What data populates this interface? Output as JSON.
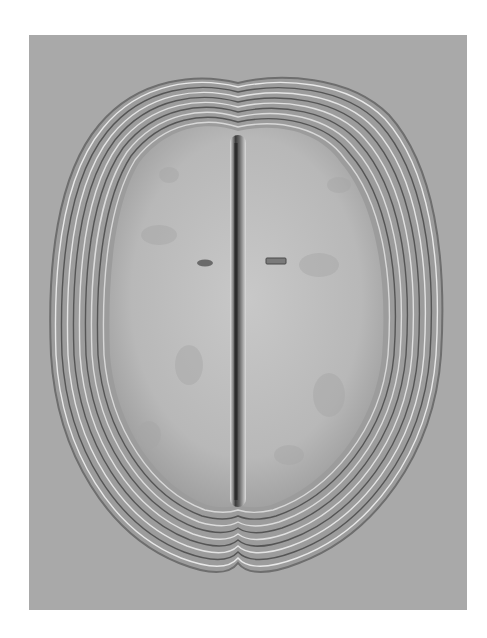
{
  "image": {
    "subject": "metal shield with concentric ribbed border and central vertical ridge",
    "background_color": "#a9a9a9",
    "page_color": "#ffffff",
    "object_color": "#bdbdbd",
    "ridge_color": "#5a5a5a",
    "border_rings": 9
  }
}
